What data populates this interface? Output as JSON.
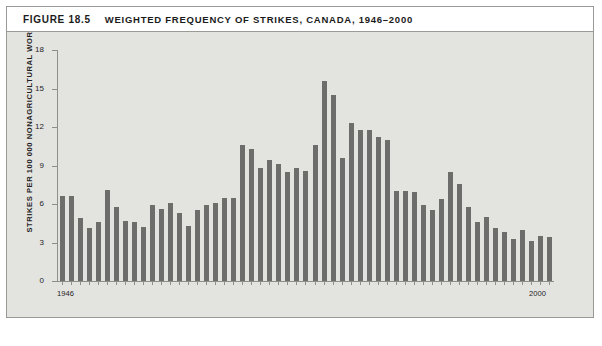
{
  "figure": {
    "number": "FIGURE 18.5",
    "title": "WEIGHTED FREQUENCY OF STRIKES, CANADA, 1946–2000"
  },
  "colors": {
    "bar": "#6d6d6b",
    "panel_background": "#e3e3e0",
    "axis": "#8e8e8a",
    "frame": "#9a9a96",
    "text": "#1b1b1b"
  },
  "chart_data": {
    "type": "bar",
    "title": "WEIGHTED FREQUENCY OF STRIKES, CANADA, 1946–2000",
    "xlabel": "YEAR",
    "ylabel": "STRIKES PER 100 000 NONAGRICULTURAL WORKERS",
    "ylim": [
      0,
      18
    ],
    "yticks": [
      0,
      3,
      6,
      9,
      12,
      15,
      18
    ],
    "ytick_labels": [
      "0",
      "3",
      "6",
      "9",
      "12",
      "15",
      "18"
    ],
    "xtick_labels": [
      "1946",
      "2000"
    ],
    "xlim": [
      1946,
      2000
    ],
    "grid": false,
    "legend": null,
    "categories": [
      "1946",
      "1947",
      "1948",
      "1949",
      "1950",
      "1951",
      "1952",
      "1953",
      "1954",
      "1955",
      "1956",
      "1957",
      "1958",
      "1959",
      "1960",
      "1961",
      "1962",
      "1963",
      "1964",
      "1965",
      "1966",
      "1967",
      "1968",
      "1969",
      "1970",
      "1971",
      "1972",
      "1973",
      "1974",
      "1975",
      "1976",
      "1977",
      "1978",
      "1979",
      "1980",
      "1981",
      "1982",
      "1983",
      "1984",
      "1985",
      "1986",
      "1987",
      "1988",
      "1989",
      "1990",
      "1991",
      "1992",
      "1993",
      "1994",
      "1995",
      "1996",
      "1997",
      "1998",
      "1999",
      "2000"
    ],
    "values": [
      6.6,
      6.6,
      4.9,
      4.1,
      4.6,
      7.1,
      5.8,
      4.7,
      4.6,
      4.2,
      5.9,
      5.6,
      6.1,
      5.3,
      4.3,
      5.5,
      5.9,
      6.1,
      6.5,
      6.5,
      10.6,
      10.3,
      8.8,
      9.4,
      9.1,
      8.5,
      8.8,
      8.6,
      10.6,
      15.6,
      14.5,
      9.6,
      12.3,
      11.8,
      11.8,
      11.2,
      11.0,
      7.0,
      7.0,
      6.9,
      5.9,
      5.5,
      6.4,
      8.5,
      7.6,
      5.8,
      4.6,
      5.0,
      4.1,
      3.8,
      3.3,
      4.0,
      3.1,
      3.5,
      3.4
    ]
  }
}
